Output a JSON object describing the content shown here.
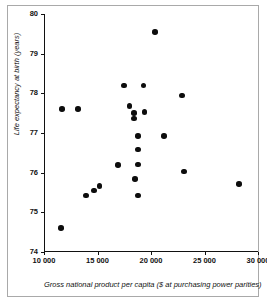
{
  "chart_data": {
    "type": "scatter",
    "title": "",
    "xlabel": "Gross national product per capita ($ at purchasing power parities)",
    "ylabel": "Life expectancy at birth (years)",
    "xlim": [
      10000,
      30000
    ],
    "ylim": [
      74,
      80
    ],
    "grid": false,
    "legend": null,
    "xticks": [
      10000,
      15000,
      20000,
      25000,
      30000
    ],
    "xtick_labels": [
      "10 000",
      "15 000",
      "20 000",
      "25 000",
      "30 000"
    ],
    "yticks": [
      74,
      75,
      76,
      77,
      78,
      79,
      80
    ],
    "ytick_labels": [
      "74",
      "75",
      "76",
      "77",
      "78",
      "79",
      "80"
    ],
    "marker": {
      "shape": "circle",
      "color": "#0d0d0d",
      "size_px": 5.6
    },
    "points": [
      {
        "x": 20400,
        "y": 79.55
      },
      {
        "x": 17500,
        "y": 78.2
      },
      {
        "x": 19300,
        "y": 78.2
      },
      {
        "x": 22900,
        "y": 77.95
      },
      {
        "x": 11700,
        "y": 77.6
      },
      {
        "x": 13200,
        "y": 77.6
      },
      {
        "x": 18000,
        "y": 77.68
      },
      {
        "x": 18400,
        "y": 77.5
      },
      {
        "x": 19400,
        "y": 77.53
      },
      {
        "x": 18400,
        "y": 77.37
      },
      {
        "x": 18800,
        "y": 76.92
      },
      {
        "x": 21200,
        "y": 76.92
      },
      {
        "x": 18800,
        "y": 76.58
      },
      {
        "x": 16900,
        "y": 76.2
      },
      {
        "x": 18800,
        "y": 76.21
      },
      {
        "x": 23100,
        "y": 76.03
      },
      {
        "x": 18500,
        "y": 75.84
      },
      {
        "x": 28200,
        "y": 75.71
      },
      {
        "x": 15200,
        "y": 75.66
      },
      {
        "x": 14700,
        "y": 75.55
      },
      {
        "x": 13900,
        "y": 75.42
      },
      {
        "x": 18800,
        "y": 75.42
      },
      {
        "x": 11600,
        "y": 74.61
      }
    ]
  },
  "axes": {
    "ylabel_text": "Life expectancy at birth (years)",
    "xlabel_text": "Gross national product per capita ($ at purchasing power parities)"
  }
}
